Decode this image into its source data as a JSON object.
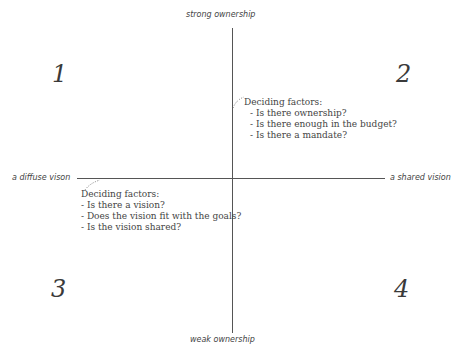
{
  "axes": {
    "top": "strong ownership",
    "bottom": "weak ownership",
    "left": "a diffuse vison",
    "right": "a shared vision"
  },
  "quadrants": [
    {
      "number": "1"
    },
    {
      "number": "2"
    },
    {
      "number": "3"
    },
    {
      "number": "4"
    }
  ],
  "annotations": {
    "ownership": {
      "title": "Deciding factors:",
      "items": [
        "Is there ownership?",
        "Is there enough in the budget?",
        "Is there a mandate?"
      ]
    },
    "vision": {
      "title": "Deciding factors:",
      "items": [
        "Is there a vision?",
        "Does the vision fit with the goals?",
        "Is the vision shared?"
      ]
    }
  },
  "colors": {
    "line": "#555555",
    "text": "#444444"
  }
}
